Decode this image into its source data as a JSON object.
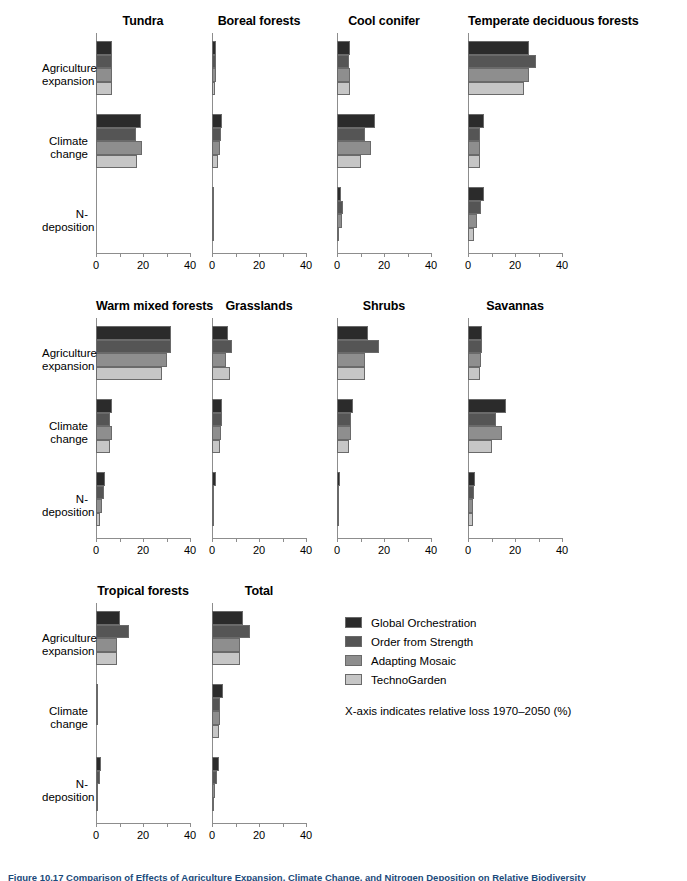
{
  "figure": {
    "caption": "Figure 10.17  Comparison of Effects of Agriculture Expansion, Climate Change, and Nitrogen Deposition on Relative Biodiversity",
    "axis_note": "X-axis indicates relative loss 1970–2050 (%)"
  },
  "legend": {
    "position": "right-middle",
    "entries": [
      {
        "label": "Global Orchestration",
        "color": "#2b2b2b"
      },
      {
        "label": "Order from Strength",
        "color": "#555555"
      },
      {
        "label": "Adapting Mosaic",
        "color": "#8e8e8e"
      },
      {
        "label": "TechnoGarden",
        "color": "#c6c6c6"
      }
    ]
  },
  "axis": {
    "ticks": [
      0,
      10,
      20,
      30,
      40
    ],
    "tick_labels": [
      "0",
      "",
      "20",
      "",
      "40"
    ],
    "xlim": [
      0,
      40
    ]
  },
  "categories": [
    "Agriculture\nexpansion",
    "Climate\nchange",
    "N-deposition"
  ],
  "chart_data": {
    "type": "bar",
    "title": "Comparison of Effects of Agriculture Expansion, Climate Change, and Nitrogen Deposition on Relative Biodiversity",
    "xlabel": "X-axis indicates relative loss 1970–2050 (%)",
    "ylabel": "",
    "xlim": [
      0,
      40
    ],
    "grid": false,
    "orientation": "horizontal",
    "legend_position": "right-middle",
    "categories": [
      "Agriculture expansion",
      "Climate change",
      "N-deposition"
    ],
    "series_names": [
      "Global Orchestration",
      "Order from Strength",
      "Adapting Mosaic",
      "TechnoGarden"
    ],
    "series_colors": [
      "#2b2b2b",
      "#555555",
      "#8e8e8e",
      "#c6c6c6"
    ],
    "panels": [
      {
        "name": "Tundra",
        "row": 0,
        "col": 0,
        "values": {
          "Agriculture expansion": [
            7.0,
            7.0,
            7.0,
            7.0
          ],
          "Climate change": [
            19.0,
            17.0,
            19.5,
            17.5
          ],
          "N-deposition": [
            0.0,
            0.0,
            0.0,
            0.0
          ]
        }
      },
      {
        "name": "Boreal forests",
        "row": 0,
        "col": 1,
        "values": {
          "Agriculture expansion": [
            1.6,
            1.6,
            1.5,
            1.4
          ],
          "Climate change": [
            4.2,
            3.8,
            3.2,
            2.6
          ],
          "N-deposition": [
            0.8,
            0.8,
            0.7,
            0.7
          ]
        }
      },
      {
        "name": "Cool conifer",
        "row": 0,
        "col": 2,
        "values": {
          "Agriculture expansion": [
            5.6,
            5.2,
            5.6,
            5.6
          ],
          "Climate change": [
            16.0,
            12.0,
            14.5,
            10.0
          ],
          "N-deposition": [
            1.6,
            2.6,
            2.0,
            1.0
          ]
        }
      },
      {
        "name": "Temperate deciduous forests",
        "row": 0,
        "col": 3,
        "values": {
          "Agriculture expansion": [
            26.0,
            29.0,
            26.0,
            24.0
          ],
          "Climate change": [
            6.6,
            5.2,
            5.0,
            5.0
          ],
          "N-deposition": [
            7.0,
            5.6,
            4.0,
            2.6
          ]
        }
      },
      {
        "name": "Warm mixed forests",
        "row": 1,
        "col": 0,
        "values": {
          "Agriculture expansion": [
            32.0,
            32.0,
            30.0,
            28.0
          ],
          "Climate change": [
            7.0,
            6.0,
            7.0,
            6.0
          ],
          "N-deposition": [
            4.0,
            3.4,
            2.4,
            1.6
          ]
        }
      },
      {
        "name": "Grasslands",
        "row": 1,
        "col": 1,
        "values": {
          "Agriculture expansion": [
            7.0,
            8.6,
            6.0,
            7.6
          ],
          "Climate change": [
            4.2,
            4.2,
            4.0,
            3.4
          ],
          "N-deposition": [
            1.6,
            0.9,
            0.6,
            0.5
          ]
        }
      },
      {
        "name": "Shrubs",
        "row": 1,
        "col": 2,
        "values": {
          "Agriculture expansion": [
            13.0,
            18.0,
            12.0,
            12.0
          ],
          "Climate change": [
            6.6,
            6.0,
            6.0,
            5.2
          ],
          "N-deposition": [
            1.1,
            0.9,
            0.7,
            0.5
          ]
        }
      },
      {
        "name": "Savannas",
        "row": 1,
        "col": 3,
        "values": {
          "Agriculture expansion": [
            6.0,
            6.0,
            5.6,
            5.0
          ],
          "Climate change": [
            16.0,
            12.0,
            14.5,
            10.0
          ],
          "N-deposition": [
            3.0,
            2.6,
            2.0,
            2.0
          ]
        }
      },
      {
        "name": "Tropical forests",
        "row": 2,
        "col": 0,
        "values": {
          "Agriculture expansion": [
            10.0,
            14.0,
            9.0,
            9.0
          ],
          "Climate change": [
            0.5,
            0.4,
            0.4,
            0.3
          ],
          "N-deposition": [
            2.0,
            1.5,
            1.0,
            0.6
          ]
        }
      },
      {
        "name": "Total",
        "row": 2,
        "col": 1,
        "values": {
          "Agriculture expansion": [
            13.0,
            16.0,
            12.0,
            12.0
          ],
          "Climate change": [
            4.6,
            3.6,
            3.6,
            3.0
          ],
          "N-deposition": [
            3.0,
            2.0,
            1.2,
            0.8
          ]
        }
      }
    ]
  }
}
